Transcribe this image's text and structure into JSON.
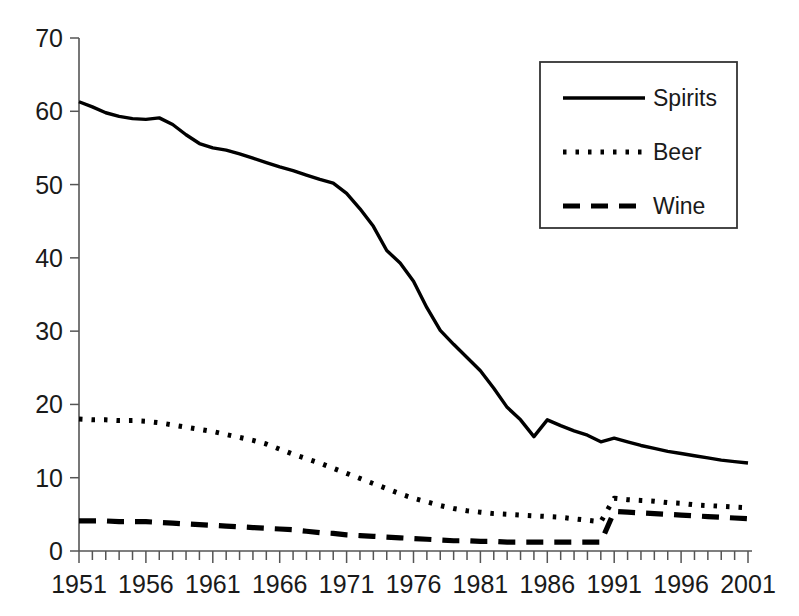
{
  "chart_data": {
    "type": "line",
    "title": "",
    "subtitle": "",
    "xlabel": "",
    "ylabel": "",
    "xlim": [
      1951,
      2001
    ],
    "ylim": [
      0,
      70
    ],
    "yticks": [
      0,
      10,
      20,
      30,
      40,
      50,
      60,
      70
    ],
    "ytick_labels": [
      "0",
      "10",
      "20",
      "30",
      "40",
      "50",
      "60",
      "70"
    ],
    "xticks": [
      1951,
      1956,
      1961,
      1966,
      1971,
      1976,
      1981,
      1986,
      1991,
      1996,
      2001
    ],
    "xtick_labels": [
      "1951",
      "1956",
      "1961",
      "1966",
      "1971",
      "1976",
      "1981",
      "1986",
      "1991",
      "1996",
      "2001"
    ],
    "x_minor_tick_interval": 1,
    "grid": false,
    "legend_position": "top-right",
    "x": [
      1951,
      1952,
      1953,
      1954,
      1955,
      1956,
      1957,
      1958,
      1959,
      1960,
      1961,
      1962,
      1963,
      1964,
      1965,
      1966,
      1967,
      1968,
      1969,
      1970,
      1971,
      1972,
      1973,
      1974,
      1975,
      1976,
      1977,
      1978,
      1979,
      1980,
      1981,
      1982,
      1983,
      1984,
      1985,
      1986,
      1987,
      1988,
      1989,
      1990,
      1991,
      1992,
      1993,
      1994,
      1995,
      1996,
      1997,
      1998,
      1999,
      2000,
      2001
    ],
    "series": [
      {
        "name": "Spirits",
        "line_style": "solid",
        "color": "#000000",
        "values": [
          61.3,
          60.6,
          59.8,
          59.3,
          59.0,
          58.9,
          59.1,
          58.2,
          56.8,
          55.6,
          55.0,
          54.7,
          54.2,
          53.6,
          53.0,
          52.4,
          51.9,
          51.3,
          50.7,
          50.2,
          48.8,
          46.7,
          44.3,
          41.0,
          39.3,
          36.8,
          33.2,
          30.1,
          28.2,
          26.4,
          24.6,
          22.2,
          19.6,
          17.9,
          15.6,
          17.9,
          17.1,
          16.4,
          15.8,
          14.9,
          15.4,
          14.9,
          14.4,
          14.0,
          13.6,
          13.3,
          13.0,
          12.7,
          12.4,
          12.2,
          12.0
        ]
      },
      {
        "name": "Beer",
        "line_style": "dotted",
        "color": "#000000",
        "values": [
          18.0,
          17.9,
          17.9,
          17.8,
          17.8,
          17.7,
          17.5,
          17.2,
          16.9,
          16.6,
          16.3,
          15.9,
          15.5,
          15.1,
          14.6,
          13.9,
          13.2,
          12.6,
          12.0,
          11.3,
          10.6,
          9.9,
          9.2,
          8.5,
          7.8,
          7.2,
          6.7,
          6.2,
          5.8,
          5.5,
          5.3,
          5.1,
          5.0,
          4.9,
          4.8,
          4.7,
          4.6,
          4.4,
          4.2,
          4.0,
          7.2,
          7.0,
          6.9,
          6.8,
          6.6,
          6.5,
          6.3,
          6.2,
          6.1,
          6.0,
          5.9
        ]
      },
      {
        "name": "Wine",
        "line_style": "dashed",
        "color": "#000000",
        "values": [
          4.1,
          4.1,
          4.1,
          4.0,
          4.0,
          4.0,
          3.9,
          3.8,
          3.7,
          3.6,
          3.5,
          3.4,
          3.3,
          3.2,
          3.1,
          3.0,
          2.9,
          2.7,
          2.5,
          2.4,
          2.2,
          2.1,
          2.0,
          1.9,
          1.8,
          1.7,
          1.6,
          1.5,
          1.4,
          1.4,
          1.3,
          1.3,
          1.2,
          1.2,
          1.2,
          1.2,
          1.2,
          1.2,
          1.2,
          1.2,
          5.4,
          5.3,
          5.2,
          5.1,
          5.0,
          4.9,
          4.8,
          4.7,
          4.6,
          4.5,
          4.4
        ]
      }
    ],
    "legend": [
      {
        "label": "Spirits",
        "line_style": "solid"
      },
      {
        "label": "Beer",
        "line_style": "dotted"
      },
      {
        "label": "Wine",
        "line_style": "dashed"
      }
    ]
  },
  "colors": {
    "background": "#ffffff",
    "ink": "#000000",
    "axis": "#555555"
  }
}
